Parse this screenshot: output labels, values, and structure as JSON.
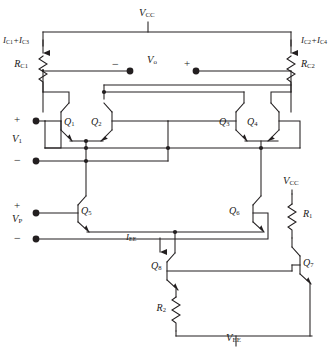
{
  "figure": {
    "kind": "circuit-schematic",
    "line_color": "#231f20",
    "background": "#ffffff"
  },
  "rails": {
    "vcc_top": "V<sub>CC</sub>",
    "vcc_right": "V<sub>CC</sub>",
    "vee": "V<sub>EE</sub>"
  },
  "currents": {
    "left_collector": "I<sub>C1</sub>+I<sub>C3</sub>",
    "right_collector": "I<sub>C2</sub>+I<sub>C4</sub>",
    "tail": "I<sub>EE</sub>"
  },
  "resistors": {
    "rc1": "R<sub>C1</sub>",
    "rc2": "R<sub>C2</sub>",
    "r1": "R<sub>1</sub>",
    "r2": "R<sub>2</sub>"
  },
  "transistors": {
    "q1": "Q<sub>1</sub>",
    "q2": "Q<sub>2</sub>",
    "q3": "Q<sub>3</sub>",
    "q4": "Q<sub>4</sub>",
    "q5": "Q<sub>5</sub>",
    "q6": "Q<sub>6</sub>",
    "q7": "Q<sub>7</sub>",
    "q8": "Q<sub>8</sub>"
  },
  "ports": {
    "output": {
      "label": "V<sub>o</sub>",
      "minus": "−",
      "plus": "+"
    },
    "input_v1": {
      "label": "V<sub>1</sub>",
      "plus": "+",
      "minus": "−"
    },
    "input_vp": {
      "label": "V<sub>P</sub>",
      "plus": "+",
      "minus": "−"
    }
  }
}
